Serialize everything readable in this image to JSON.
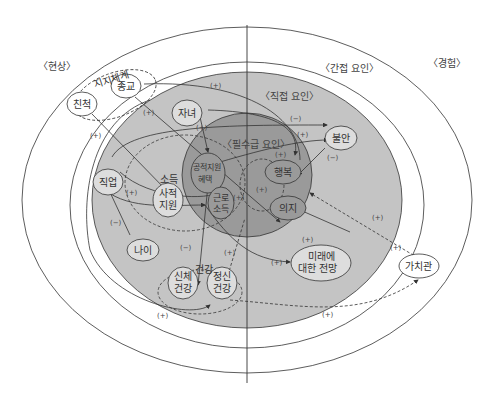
{
  "regions": {
    "phenomenon": "〈현상〉",
    "indirect": "〈간접 요인〉",
    "experience": "〈경험〉",
    "direct": "〈직접 요인〉",
    "essential": "〈필수급 요인〉"
  },
  "groups": {
    "support": "지지체계",
    "income": "소득",
    "health": "건강"
  },
  "nodes": {
    "relatives": "친척",
    "religion": "종교",
    "children": "자녀",
    "job": "직업",
    "age": "나이",
    "private_support_1": "사적",
    "private_support_2": "지원",
    "public_support_1": "공적지원",
    "public_support_2": "혜택",
    "work_income_1": "근로",
    "work_income_2": "소득",
    "physical_health_1": "신체",
    "physical_health_2": "건강",
    "mental_health_1": "정신",
    "mental_health_2": "건강",
    "anxiety": "불안",
    "happiness": "행복",
    "will": "의지",
    "future_1": "미래에",
    "future_2": "대한 전망",
    "values": "가치관"
  },
  "signs": {
    "plus": "(+)",
    "minus": "(−)"
  },
  "colors": {
    "outer_fill": "#ffffff",
    "direct_fill": "#c4c4c4",
    "essential_fill": "#9a9a9a",
    "line": "#333333"
  }
}
